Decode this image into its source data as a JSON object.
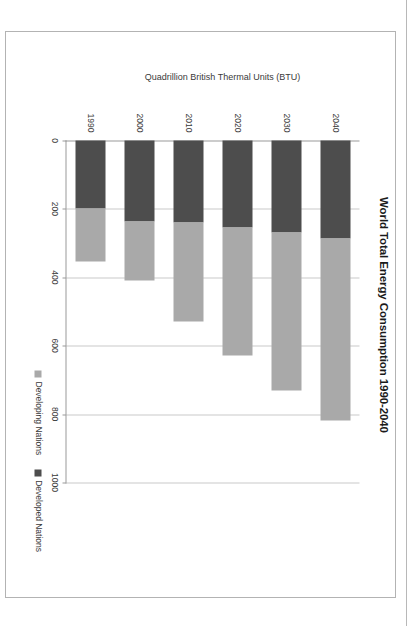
{
  "chart_data": {
    "type": "bar",
    "orientation": "horizontal-stacked",
    "title": "World Total Energy Consumption 1990-2040",
    "xlabel": "",
    "ylabel": "Quadrillion British Thermal Units (BTU)",
    "categories": [
      "1990",
      "2000",
      "2010",
      "2020",
      "2030",
      "2040"
    ],
    "series": [
      {
        "name": "Developed Nations",
        "color": "#4d4d4d",
        "values": [
          200,
          236,
          239,
          254,
          269,
          286
        ]
      },
      {
        "name": "Developing Nations",
        "color": "#a9a9a9",
        "values": [
          154,
          172,
          289,
          375,
          463,
          533
        ]
      }
    ],
    "totals": [
      354,
      408,
      528,
      629,
      732,
      819
    ],
    "value_axis": {
      "ticks": [
        "0",
        "200",
        "400",
        "600",
        "800",
        "1000"
      ],
      "min": 0,
      "max": 1000,
      "interval": 200
    },
    "grid": true,
    "legend_position": "bottom-right",
    "stacked": true
  },
  "legend": {
    "items": [
      {
        "label": "Developing Nations",
        "color": "#a9a9a9"
      },
      {
        "label": "Developed Nations",
        "color": "#4d4d4d"
      }
    ]
  }
}
